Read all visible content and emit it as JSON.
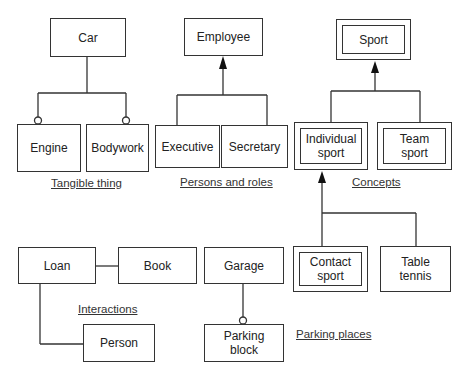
{
  "diagram": {
    "groups": {
      "tangible": {
        "label": "Tangible thing",
        "parent": "Car",
        "children": [
          "Engine",
          "Bodywork"
        ],
        "relation": "aggregation (circle connectors)"
      },
      "persons": {
        "label": "Persons and roles",
        "parent": "Employee",
        "children": [
          "Executive",
          "Secretary"
        ],
        "relation": "generalization (arrow)"
      },
      "concepts": {
        "label": "Concepts",
        "parent": "Sport",
        "children": [
          "Individual\nsport",
          "Team\nsport"
        ],
        "subchildren": [
          "Contact\nsport",
          "Table\ntennis"
        ],
        "relation": "generalization (arrow)"
      },
      "interactions": {
        "label": "Interactions",
        "nodes": [
          "Loan",
          "Book",
          "Person"
        ]
      },
      "parking": {
        "label": "Parking places",
        "parent": "Garage",
        "child": "Parking\nblock"
      }
    }
  }
}
